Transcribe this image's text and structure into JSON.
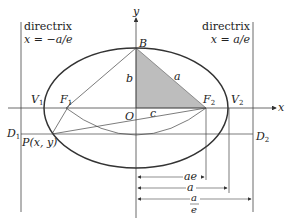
{
  "diagram": {
    "type": "ellipse-geometry",
    "colors": {
      "ink": "#333333",
      "shade": "#bdbdbd",
      "background": "#ffffff"
    },
    "axes": {
      "x_label": "x",
      "y_label": "y",
      "origin_label": "O"
    },
    "directrix_left": {
      "title": "directrix",
      "equation": "x = −a/e"
    },
    "directrix_right": {
      "title": "directrix",
      "equation": "x = a/e"
    },
    "points": {
      "B": "B",
      "F1": "F",
      "F1_sub": "1",
      "F2": "F",
      "F2_sub": "2",
      "V1": "V",
      "V1_sub": "1",
      "V2": "V",
      "V2_sub": "2",
      "D1": "D",
      "D1_sub": "1",
      "D2": "D",
      "D2_sub": "2",
      "P": "P(x, y)"
    },
    "segments": {
      "a": "a",
      "b": "b",
      "c": "c"
    },
    "dimensions": {
      "ae": "ae",
      "a": "a",
      "a_over_e_num": "a",
      "a_over_e_den": "e"
    }
  }
}
